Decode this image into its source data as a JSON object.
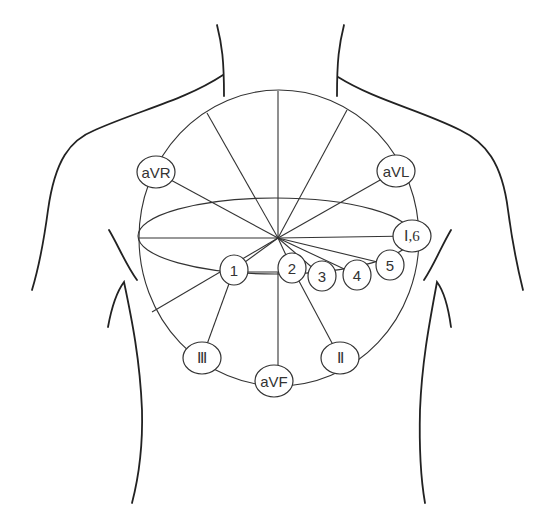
{
  "diagram": {
    "center": {
      "x": 278,
      "y": 238
    },
    "limb_leads": [
      {
        "id": "aVR",
        "label": "aVR",
        "x": 156,
        "y": 172
      },
      {
        "id": "aVL",
        "label": "aVL",
        "x": 396,
        "y": 171
      },
      {
        "id": "I6",
        "label": "Ⅰ,6",
        "x": 412,
        "y": 236
      },
      {
        "id": "III",
        "label": "Ⅲ",
        "x": 202,
        "y": 358
      },
      {
        "id": "aVF",
        "label": "aVF",
        "x": 272,
        "y": 380
      },
      {
        "id": "II",
        "label": "Ⅱ",
        "x": 340,
        "y": 358
      }
    ],
    "precordial_leads": [
      {
        "id": "V1",
        "label": "1",
        "x": 234,
        "y": 270
      },
      {
        "id": "V2",
        "label": "2",
        "x": 292,
        "y": 268
      },
      {
        "id": "V3",
        "label": "3",
        "x": 322,
        "y": 276
      },
      {
        "id": "V4",
        "label": "4",
        "x": 357,
        "y": 275
      },
      {
        "id": "V5",
        "label": "5",
        "x": 390,
        "y": 265
      }
    ]
  }
}
